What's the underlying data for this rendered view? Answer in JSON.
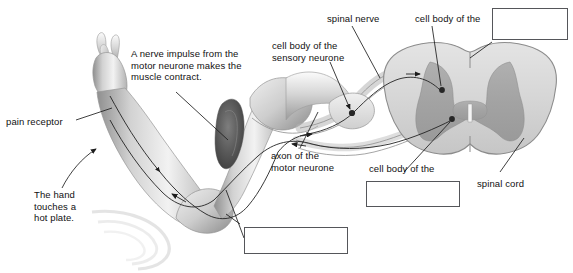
{
  "diagram": {
    "type": "labelled-biology-diagram",
    "colors": {
      "background": "#ffffff",
      "label_text": "#111111",
      "leader_line": "#1d1d1d",
      "box_border": "#55565a",
      "grey_matter": "#a8a8a8",
      "white_matter": "#d9d9d9",
      "skin_light": "#e9e9e9",
      "skin_mid": "#c3c3c3",
      "skin_dark": "#8d8d8d",
      "muscle_dark": "#5d5d5d"
    }
  },
  "labels": {
    "pain_receptor": "pain receptor",
    "nerve_impulse_note": "A nerve impulse from the\nmotor neurone makes the\nmuscle contract.",
    "hand_touches_note": "The hand\ntouches a\nhot plate.",
    "axon_motor_neurone": "axon of the\nmotor neurone",
    "cell_body_sensory_neurone": "cell body of the\nsensory neurone",
    "spinal_nerve": "spinal nerve",
    "cell_body_of_the_top": "cell body of the",
    "cell_body_of_the_lower": "cell body of the",
    "spinal_cord": "spinal cord"
  },
  "answer_boxes": [
    {
      "name": "answer-box-top-right",
      "value": "",
      "x": 492,
      "y": 8,
      "width": 76,
      "height": 32
    },
    {
      "name": "answer-box-middle",
      "value": "",
      "x": 366,
      "y": 181,
      "width": 94,
      "height": 26
    },
    {
      "name": "answer-box-bottom",
      "value": "",
      "x": 244,
      "y": 227,
      "width": 104,
      "height": 27
    }
  ]
}
